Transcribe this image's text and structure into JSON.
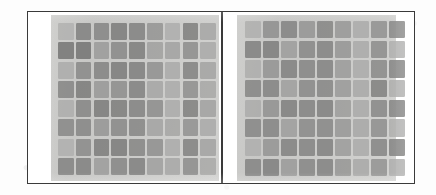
{
  "figure": {
    "caption": "",
    "frame_color": "#3a3a3a",
    "paper_color": "#fdfdfd",
    "panel_background_color": "#d2d2d0",
    "panel_count": 2
  },
  "chart_data": {
    "type": "heatmap",
    "title": "",
    "subtitle": "",
    "xlabel": "",
    "ylabel": "",
    "grid": false,
    "legend": "none",
    "rows": 8,
    "cols": 9,
    "value_range": [
      0,
      100
    ],
    "colormap": "grayscale-dark-is-high",
    "panels": [
      {
        "name": "left-panel",
        "label": "",
        "rows": 8,
        "cols": 9,
        "values": [
          [
            18,
            62,
            58,
            66,
            61,
            45,
            22,
            63,
            30
          ],
          [
            70,
            72,
            40,
            55,
            64,
            35,
            33,
            52,
            26
          ],
          [
            24,
            55,
            60,
            66,
            63,
            48,
            26,
            60,
            32
          ],
          [
            58,
            66,
            42,
            52,
            61,
            30,
            24,
            50,
            28
          ],
          [
            22,
            58,
            66,
            64,
            60,
            52,
            25,
            62,
            34
          ],
          [
            56,
            58,
            44,
            55,
            57,
            32,
            30,
            48,
            26
          ],
          [
            20,
            54,
            64,
            66,
            58,
            50,
            24,
            60,
            33
          ],
          [
            60,
            62,
            38,
            57,
            62,
            36,
            28,
            52,
            27
          ]
        ]
      },
      {
        "name": "right-panel",
        "label": "",
        "rows": 8,
        "cols": 9,
        "values": [
          [
            20,
            50,
            60,
            45,
            58,
            42,
            24,
            48,
            58
          ],
          [
            62,
            64,
            38,
            56,
            60,
            44,
            26,
            52,
            22
          ],
          [
            22,
            46,
            62,
            58,
            60,
            40,
            25,
            54,
            60
          ],
          [
            58,
            60,
            36,
            55,
            57,
            41,
            27,
            62,
            24
          ],
          [
            24,
            48,
            63,
            60,
            62,
            38,
            26,
            56,
            61
          ],
          [
            57,
            59,
            37,
            54,
            56,
            42,
            28,
            50,
            23
          ],
          [
            21,
            45,
            61,
            59,
            61,
            39,
            25,
            58,
            62
          ],
          [
            59,
            63,
            40,
            57,
            60,
            43,
            27,
            46,
            25
          ]
        ]
      }
    ]
  }
}
